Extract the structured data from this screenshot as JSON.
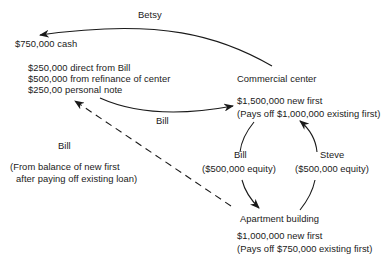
{
  "diagram": {
    "flows": {
      "betsy_label": "Betsy",
      "bill_top_label": "Bill",
      "bill_equity_label": "Bill",
      "bill_equity_amount": "($500,000 equity)",
      "steve_equity_label": "Steve",
      "steve_equity_amount": "($500,000 equity)",
      "bill_dashed_label": "Bill",
      "bill_dashed_note_line1": "(From balance of new first",
      "bill_dashed_note_line2": "after paying off existing loan)"
    },
    "cash_node": {
      "title": "$750,000 cash",
      "sources": [
        "$250,000 direct from Bill",
        "$500,000 from refinance of center",
        "$250,00 personal note"
      ]
    },
    "commercial_center": {
      "title": "Commercial center",
      "line1": "$1,500,000 new first",
      "line2": "(Pays off $1,000,000 existing first)"
    },
    "apartment_building": {
      "title": "Apartment building",
      "line1": "$1,000,000 new first",
      "line2": "(Pays off $750,000 existing first)"
    },
    "colors": {
      "ink": "#1a1a1a",
      "background": "#ffffff"
    }
  }
}
